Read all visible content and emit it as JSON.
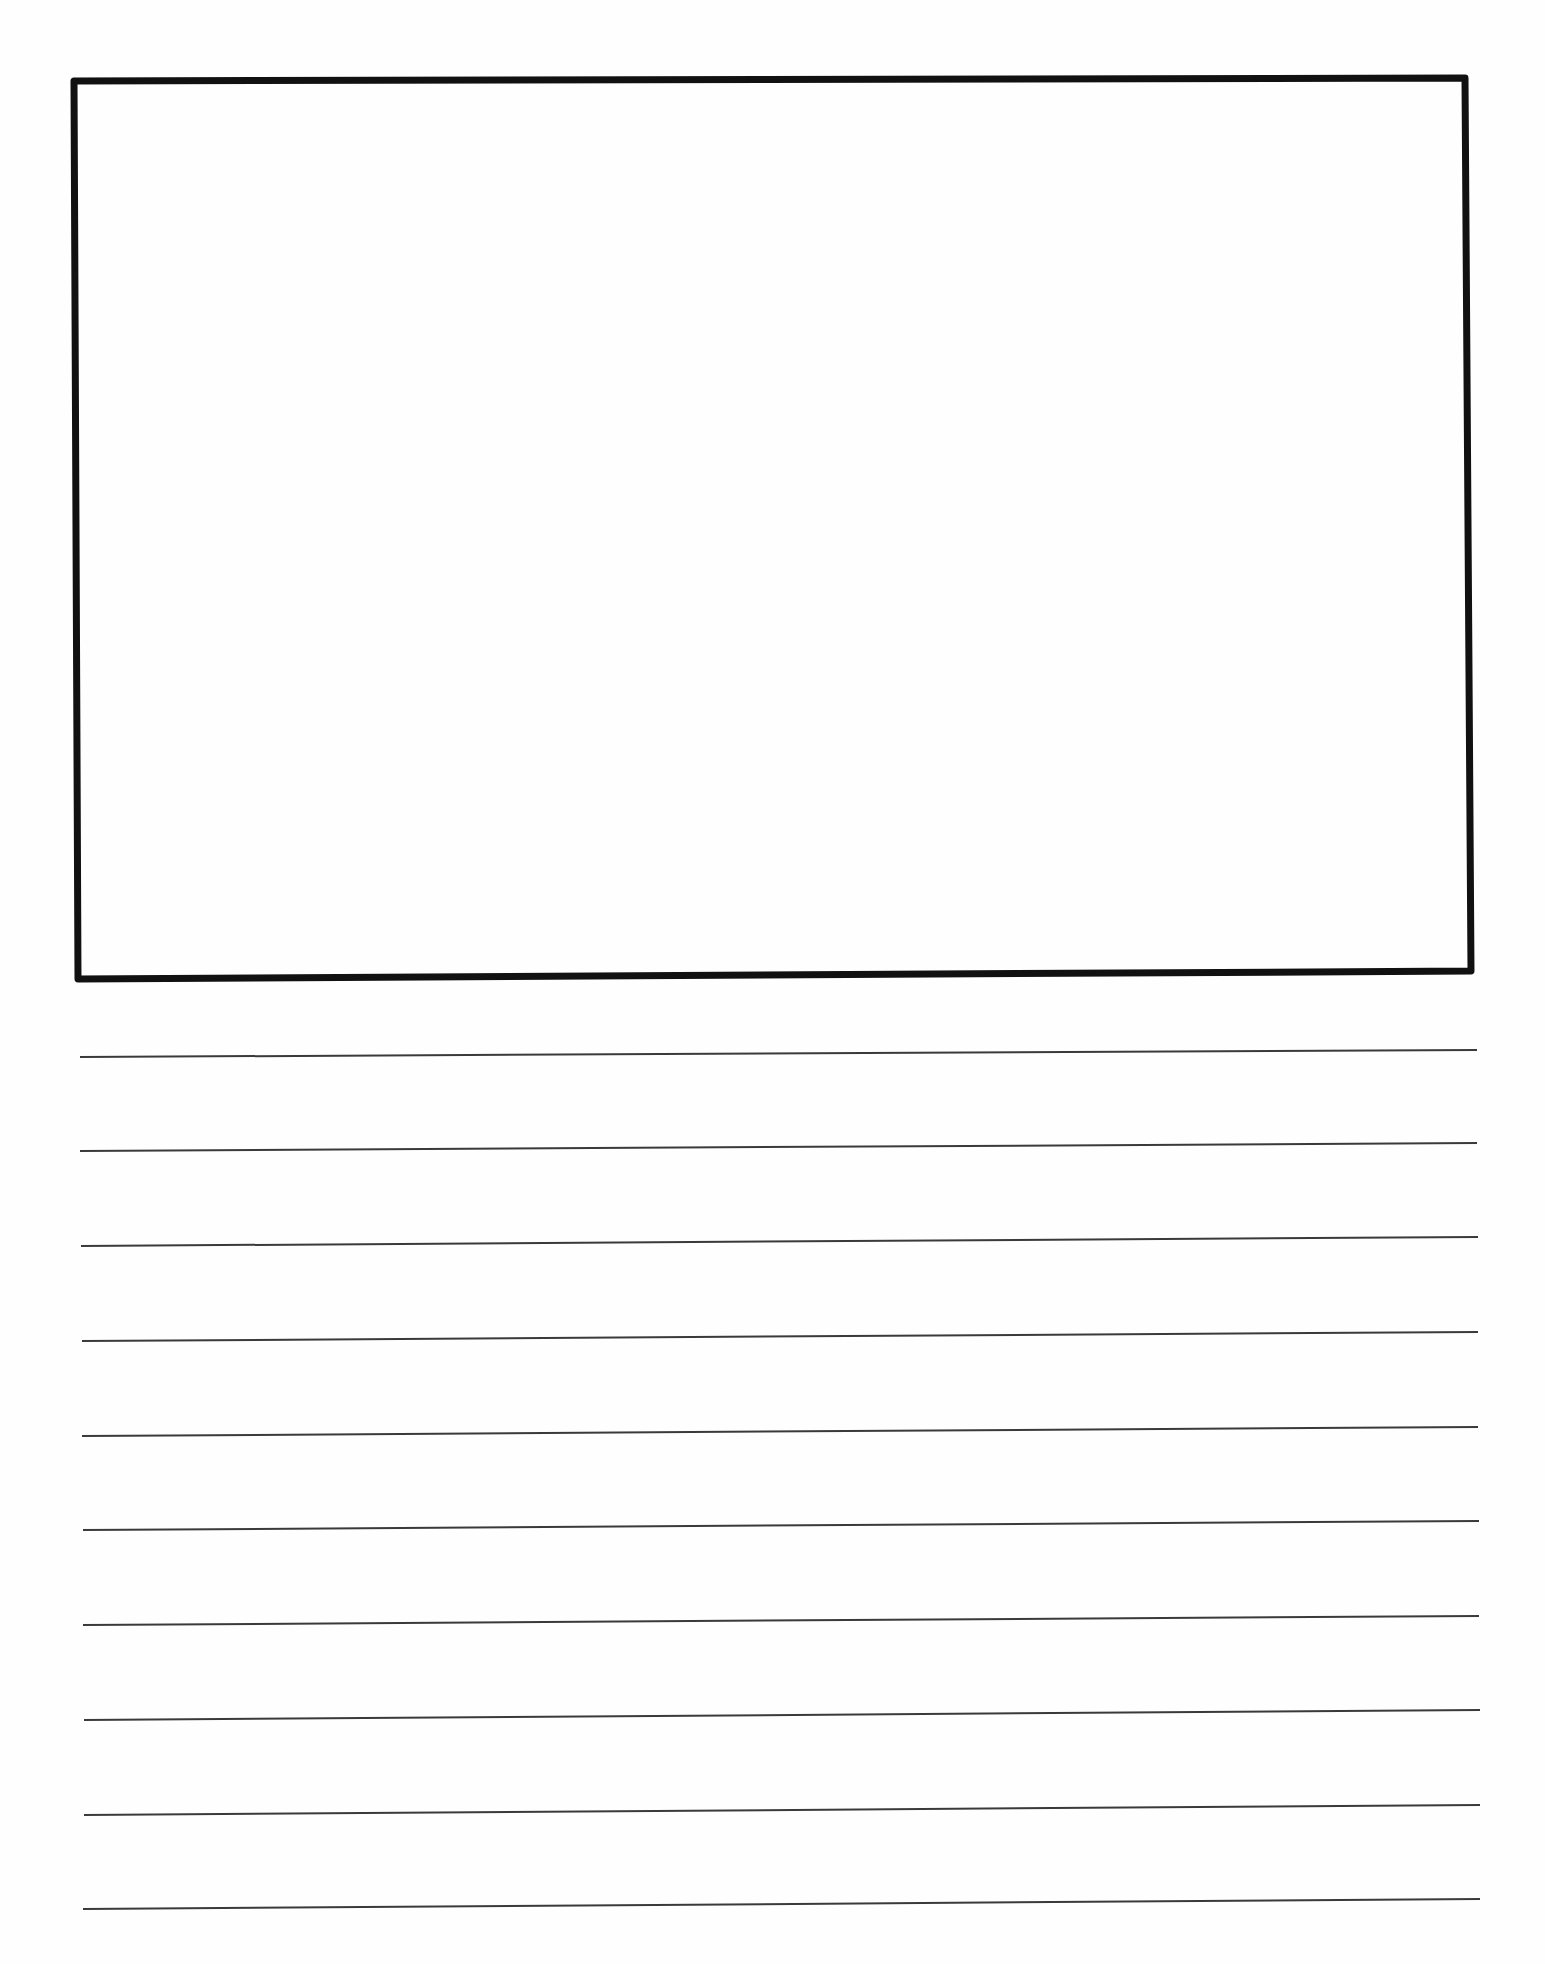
{
  "page": {
    "width": 1545,
    "height": 1964,
    "background": "#ffffff",
    "ink_color": "#111111",
    "line_color": "#3a3a3a"
  },
  "drawing_box": {
    "corners": {
      "top_left": [
        74,
        81
      ],
      "top_right": [
        1465,
        78
      ],
      "bottom_right": [
        1471,
        971
      ],
      "bottom_left": [
        78,
        979
      ]
    },
    "stroke_width": 7,
    "content": ""
  },
  "writing_lines": {
    "count": 10,
    "stroke_width": 2,
    "lines": [
      {
        "x1": 80,
        "y1": 1057,
        "x2": 1477,
        "y2": 1050
      },
      {
        "x1": 80,
        "y1": 1151,
        "x2": 1477,
        "y2": 1143
      },
      {
        "x1": 81,
        "y1": 1246,
        "x2": 1478,
        "y2": 1237
      },
      {
        "x1": 82,
        "y1": 1341,
        "x2": 1478,
        "y2": 1332
      },
      {
        "x1": 82,
        "y1": 1436,
        "x2": 1478,
        "y2": 1427
      },
      {
        "x1": 83,
        "y1": 1530,
        "x2": 1479,
        "y2": 1521
      },
      {
        "x1": 83,
        "y1": 1625,
        "x2": 1479,
        "y2": 1616
      },
      {
        "x1": 84,
        "y1": 1720,
        "x2": 1480,
        "y2": 1710
      },
      {
        "x1": 84,
        "y1": 1815,
        "x2": 1480,
        "y2": 1805
      },
      {
        "x1": 83,
        "y1": 1909,
        "x2": 1480,
        "y2": 1899
      }
    ]
  }
}
